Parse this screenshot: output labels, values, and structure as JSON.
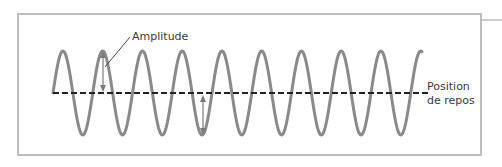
{
  "diagram": {
    "labels": {
      "amplitude": "Amplitude",
      "rest_line1": "Position",
      "rest_line2": "de repos"
    },
    "colors": {
      "frame": "#bdbdbd",
      "wave": "#8a8a8a",
      "rest_line": "#222222",
      "arrow": "#7a7a7a",
      "leader": "#444444",
      "text": "#3a3a3a"
    },
    "wave": {
      "x_start": 53,
      "x_end": 422,
      "baseline_y": 93,
      "amplitude_px": 42,
      "period_px": 39.75,
      "peak_count": 9
    }
  }
}
